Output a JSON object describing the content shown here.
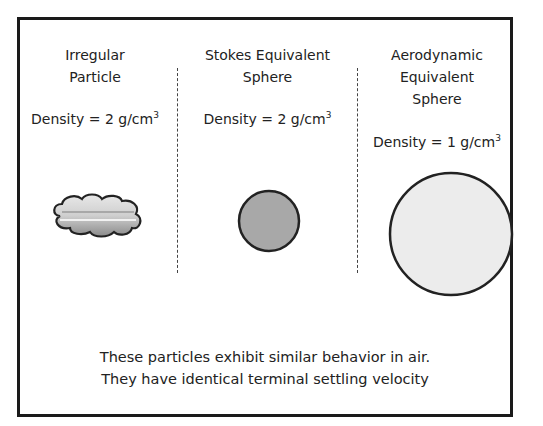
{
  "columns": [
    {
      "title_lines": [
        "Irregular",
        "Particle"
      ],
      "density_label": "Density = 2 g/cm",
      "density_exponent": "3",
      "shape": "irregular-cloud"
    },
    {
      "title_lines": [
        "Stokes Equivalent",
        "Sphere"
      ],
      "density_label": "Density = 2 g/cm",
      "density_exponent": "3",
      "shape": "small-dark-sphere"
    },
    {
      "title_lines": [
        "Aerodynamic",
        "Equivalent",
        "Sphere"
      ],
      "density_label": "Density = 1 g/cm",
      "density_exponent": "3",
      "shape": "large-light-sphere"
    }
  ],
  "caption": {
    "line1": "These particles exhibit similar behavior in air.",
    "line2": "They have identical terminal settling velocity"
  },
  "colors": {
    "border": "#1a1a1a",
    "stokes_fill": "#a8a8a8",
    "aero_fill": "#ececec",
    "cloud_fill": "#d6d6d6"
  }
}
